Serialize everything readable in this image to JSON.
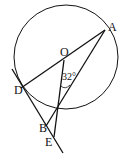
{
  "figure": {
    "points": {
      "A": "A",
      "O": "O",
      "D": "D",
      "B": "B",
      "E": "E"
    },
    "angle_label": "32°",
    "colors": {
      "stroke": "#111111",
      "background": "#ffffff"
    }
  }
}
